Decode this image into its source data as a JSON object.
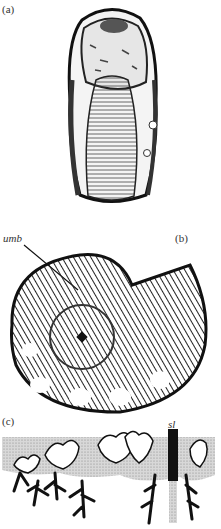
{
  "figure": {
    "panels": [
      {
        "id": "a",
        "label": "(a)",
        "description": "ammonite shell, apertural/ventral view"
      },
      {
        "id": "b",
        "label": "(b)",
        "description": "ammonite shell, lateral view",
        "annotations": [
          {
            "text": "umb",
            "meaning": "umbilicus"
          }
        ]
      },
      {
        "id": "c",
        "label": "(c)",
        "description": "suture line pattern",
        "annotations": [
          {
            "text": "sl"
          }
        ]
      }
    ]
  },
  "colors": {
    "ink": "#111111",
    "stipple": "#bdbdbd",
    "paper": "#ffffff"
  }
}
